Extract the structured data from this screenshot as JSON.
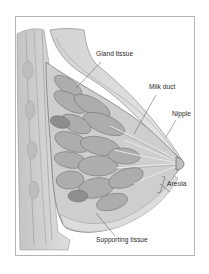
{
  "figure": {
    "labels": {
      "gland_tissue": "Gland tissue",
      "milk_duct": "Milk duct",
      "nipple": "Nipple",
      "areola": "Areola",
      "supporting_tissue": "Supporting tissue"
    },
    "colors": {
      "frame_border": "#b4b4b4",
      "tissue_fill": "#c9c9c9",
      "lobe_fill": "#a9a9a9",
      "outline": "#6e6e6e",
      "label_text": "#2a2a2a",
      "leader_line": "#555555"
    }
  }
}
